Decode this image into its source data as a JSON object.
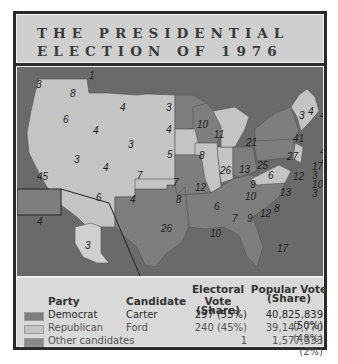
{
  "title": {
    "line1": "THE PRESIDENTIAL",
    "line2": "ELECTION OF 1976"
  },
  "colors": {
    "democrat": "#7e7e7e",
    "republican": "#c4c4c4",
    "other": "#8a8a8a",
    "water": "#6d6d6d"
  },
  "map": {
    "states": [
      {
        "name": "WA",
        "ev": "8",
        "party": "republican"
      },
      {
        "name": "WA-faithless",
        "ev": "1",
        "party": "other"
      },
      {
        "name": "OR",
        "ev": "6",
        "party": "republican"
      },
      {
        "name": "CA",
        "ev": "45",
        "party": "republican"
      },
      {
        "name": "ID",
        "ev": "4",
        "party": "republican"
      },
      {
        "name": "NV",
        "ev": "3",
        "party": "republican"
      },
      {
        "name": "MT",
        "ev": "4",
        "party": "republican"
      },
      {
        "name": "WY",
        "ev": "3",
        "party": "republican"
      },
      {
        "name": "UT",
        "ev": "4",
        "party": "republican"
      },
      {
        "name": "CO",
        "ev": "7",
        "party": "republican"
      },
      {
        "name": "AZ",
        "ev": "6",
        "party": "republican"
      },
      {
        "name": "NM",
        "ev": "4",
        "party": "republican"
      },
      {
        "name": "ND",
        "ev": "3",
        "party": "republican"
      },
      {
        "name": "SD",
        "ev": "4",
        "party": "republican"
      },
      {
        "name": "NE",
        "ev": "5",
        "party": "republican"
      },
      {
        "name": "KS",
        "ev": "7",
        "party": "republican"
      },
      {
        "name": "OK",
        "ev": "8",
        "party": "republican"
      },
      {
        "name": "TX",
        "ev": "26",
        "party": "democrat"
      },
      {
        "name": "MN",
        "ev": "10",
        "party": "democrat"
      },
      {
        "name": "IA",
        "ev": "8",
        "party": "republican"
      },
      {
        "name": "MO",
        "ev": "12",
        "party": "democrat"
      },
      {
        "name": "AR",
        "ev": "6",
        "party": "democrat"
      },
      {
        "name": "LA",
        "ev": "10",
        "party": "democrat"
      },
      {
        "name": "WI",
        "ev": "11",
        "party": "democrat"
      },
      {
        "name": "IL",
        "ev": "26",
        "party": "republican"
      },
      {
        "name": "MI",
        "ev": "21",
        "party": "republican"
      },
      {
        "name": "IN",
        "ev": "13",
        "party": "republican"
      },
      {
        "name": "OH",
        "ev": "25",
        "party": "democrat"
      },
      {
        "name": "KY",
        "ev": "9",
        "party": "democrat"
      },
      {
        "name": "TN",
        "ev": "10",
        "party": "democrat"
      },
      {
        "name": "MS",
        "ev": "7",
        "party": "democrat"
      },
      {
        "name": "AL",
        "ev": "9",
        "party": "democrat"
      },
      {
        "name": "GA",
        "ev": "12",
        "party": "democrat"
      },
      {
        "name": "FL",
        "ev": "17",
        "party": "democrat"
      },
      {
        "name": "SC",
        "ev": "8",
        "party": "democrat"
      },
      {
        "name": "NC",
        "ev": "13",
        "party": "democrat"
      },
      {
        "name": "VA",
        "ev": "12",
        "party": "republican"
      },
      {
        "name": "WV",
        "ev": "6",
        "party": "democrat"
      },
      {
        "name": "PA",
        "ev": "27",
        "party": "democrat"
      },
      {
        "name": "NY",
        "ev": "41",
        "party": "democrat"
      },
      {
        "name": "VT",
        "ev": "3",
        "party": "republican"
      },
      {
        "name": "NH",
        "ev": "4",
        "party": "republican"
      },
      {
        "name": "ME",
        "ev": "4",
        "party": "republican"
      },
      {
        "name": "MA",
        "ev": "14",
        "party": "democrat"
      },
      {
        "name": "RI",
        "ev": "4",
        "party": "democrat"
      },
      {
        "name": "CT",
        "ev": "8",
        "party": "republican"
      },
      {
        "name": "NJ",
        "ev": "17",
        "party": "republican"
      },
      {
        "name": "DE",
        "ev": "3",
        "party": "democrat"
      },
      {
        "name": "MD",
        "ev": "10",
        "party": "democrat"
      },
      {
        "name": "DC",
        "ev": "3",
        "party": "democrat"
      },
      {
        "name": "HI",
        "ev": "4",
        "party": "democrat"
      },
      {
        "name": "AK",
        "ev": "3",
        "party": "republican"
      }
    ]
  },
  "legend": {
    "headers": {
      "party": "Party",
      "candidate": "Candidate",
      "electoral_1": "Electoral Vote",
      "electoral_2": "(Share)",
      "popular_1": "Popular Vote",
      "popular_2": "(Share)"
    },
    "rows": [
      {
        "party": "Democrat",
        "candidate": "Carter",
        "electoral": "297 (55%)",
        "popular": "40,825,839 (50%)"
      },
      {
        "party": "Republican",
        "candidate": "Ford",
        "electoral": "240 (45%)",
        "popular": "39,147,770 (48%)"
      },
      {
        "party": "Other candidates",
        "candidate": "",
        "electoral": "1",
        "popular": "1,577,333 (2%)"
      }
    ]
  }
}
